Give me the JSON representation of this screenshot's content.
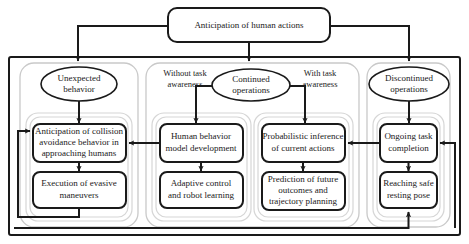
{
  "diagram": {
    "title": "Anticipation of human actions",
    "root": {
      "label": "Anticipation of human actions"
    },
    "branches": [
      {
        "key": "unexpected",
        "decision": "Unexpected behavior",
        "qualifier": "",
        "steps": [
          "Anticipation of collision avoidance behavior in approaching humans",
          "Execution of evasive maneuvers"
        ]
      },
      {
        "key": "continued-without",
        "decision": "Continued operations",
        "qualifier": "Without task awareness",
        "steps": [
          "Human behavior model development",
          "Adaptive control and robot learning"
        ]
      },
      {
        "key": "continued-with",
        "decision": "Continued operations",
        "qualifier": "With task awareness",
        "steps": [
          "Probabilistic inference of current actions",
          "Prediction of future outcomes and trajectory planning"
        ]
      },
      {
        "key": "discontinued",
        "decision": "Discontinued operations",
        "qualifier": "",
        "steps": [
          "Ongoing task completion",
          "Reaching safe resting pose"
        ]
      }
    ],
    "nodes": {
      "root_label": "Anticipation of human actions",
      "unexpected_behavior": "Unexpected behavior",
      "unexpected_behavior_line1": "Unexpected",
      "unexpected_behavior_line2": "behavior",
      "continued_operations_line1": "Continued",
      "continued_operations_line2": "operations",
      "discontinued_operations_line1": "Discontinued",
      "discontinued_operations_line2": "operations",
      "without_task_awareness_line1": "Without task",
      "without_task_awareness_line2": "awareness",
      "with_task_awareness_line1": "With task",
      "with_task_awareness_line2": "awareness",
      "anticipation_collision_line1": "Anticipation of collision",
      "anticipation_collision_line2": "avoidance behavior in",
      "anticipation_collision_line3": "approaching humans",
      "execution_evasive_line1": "Execution of evasive",
      "execution_evasive_line2": "maneuvers",
      "human_behavior_line1": "Human behavior",
      "human_behavior_line2": "model development",
      "adaptive_control_line1": "Adaptive control",
      "adaptive_control_line2": "and robot learning",
      "probabilistic_inference_line1": "Probabilistic inference",
      "probabilistic_inference_line2": "of current actions",
      "prediction_future_line1": "Prediction of future",
      "prediction_future_line2": "outcomes and",
      "prediction_future_line3": "trajectory planning",
      "ongoing_task_line1": "Ongoing task",
      "ongoing_task_line2": "completion",
      "reaching_safe_line1": "Reaching safe",
      "reaching_safe_line2": "resting pose"
    },
    "colors": {
      "stroke": "#1a1a1a",
      "panel": "#c9c9c9",
      "background": "#ffffff",
      "text": "#1a1a1a"
    }
  }
}
